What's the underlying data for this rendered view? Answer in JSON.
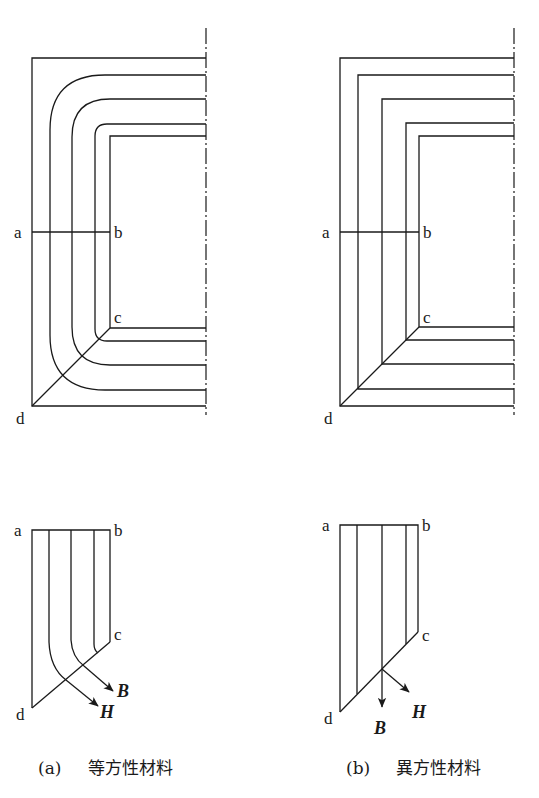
{
  "figure": {
    "panels": [
      {
        "id": "a",
        "caption_label": "(a)",
        "caption_text": "等方性材料",
        "corner_style": "rounded",
        "points": {
          "a": "a",
          "b": "b",
          "c": "c",
          "d": "d"
        },
        "vectors": {
          "B": "B",
          "H": "H"
        }
      },
      {
        "id": "b",
        "caption_label": "(b)",
        "caption_text": "異方性材料",
        "corner_style": "mitered",
        "points": {
          "a": "a",
          "b": "b",
          "c": "c",
          "d": "d"
        },
        "vectors": {
          "B": "B",
          "H": "H"
        }
      }
    ]
  }
}
